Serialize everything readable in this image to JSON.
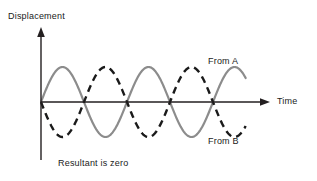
{
  "figure": {
    "caption": "Resultant is zero",
    "background_color": "#ffffff"
  },
  "axes": {
    "y_label": "Displacement",
    "x_label": "Time",
    "axis_color": "#231f20",
    "origin_x": 41,
    "origin_y": 102,
    "x_axis_end": 270,
    "y_axis_top": 27,
    "y_axis_bottom": 160
  },
  "series_labels": {
    "a": "From A",
    "b": "From B"
  },
  "chart_data": {
    "type": "line",
    "title": "",
    "subtitle": "",
    "xlabel": "Time",
    "ylabel": "Displacement",
    "annotations": [
      "From A",
      "From B",
      "Resultant is zero"
    ],
    "grid": false,
    "legend": "inline-annotation",
    "xlim": [
      0,
      2.66
    ],
    "ylim": [
      -1.2,
      1.2
    ],
    "x_unit": "wavelengths",
    "wavelength_px": 86,
    "amplitude_px": 35,
    "cycles_drawn": 2.38,
    "series": [
      {
        "name": "From A",
        "color": "#8c8c8c",
        "style": "solid",
        "width_px": 2.2,
        "amplitude": 1,
        "phase_deg": 0,
        "formula": "y = sin(2*pi*x)",
        "x": [
          0,
          0.125,
          0.25,
          0.375,
          0.5,
          0.625,
          0.75,
          0.875,
          1,
          1.125,
          1.25,
          1.375,
          1.5,
          1.625,
          1.75,
          1.875,
          2,
          2.125,
          2.25,
          2.375
        ],
        "values": [
          0,
          0.707,
          1,
          0.707,
          0,
          -0.707,
          -1,
          -0.707,
          0,
          0.707,
          1,
          0.707,
          0,
          -0.707,
          -1,
          -0.707,
          0,
          0.707,
          1,
          0.707
        ]
      },
      {
        "name": "From B",
        "color": "#1a1a1a",
        "style": "dashed",
        "dash_pattern": "7,5",
        "width_px": 2.4,
        "amplitude": 1,
        "phase_deg": 180,
        "formula": "y = -sin(2*pi*x)",
        "x": [
          0,
          0.125,
          0.25,
          0.375,
          0.5,
          0.625,
          0.75,
          0.875,
          1,
          1.125,
          1.25,
          1.375,
          1.5,
          1.625,
          1.75,
          1.875,
          2,
          2.125,
          2.25,
          2.375
        ],
        "values": [
          0,
          -0.707,
          -1,
          -0.707,
          0,
          0.707,
          1,
          0.707,
          0,
          -0.707,
          -1,
          -0.707,
          0,
          0.707,
          1,
          0.707,
          0,
          -0.707,
          -1,
          -0.707
        ]
      },
      {
        "name": "Resultant",
        "color": "#231f20",
        "style": "solid",
        "note": "Sum of From A and From B is identically zero; drawn coincident with the Time axis.",
        "x": [
          0,
          0.5,
          1,
          1.5,
          2,
          2.375
        ],
        "values": [
          0,
          0,
          0,
          0,
          0,
          0
        ]
      }
    ]
  }
}
